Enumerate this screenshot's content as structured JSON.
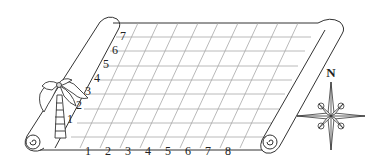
{
  "diagram": {
    "type": "treasure-map-grid",
    "grid": {
      "columns": 8,
      "rows": 8,
      "x_labels": [
        "1",
        "2",
        "3",
        "4",
        "5",
        "6",
        "7",
        "8"
      ],
      "y_labels": [
        "1",
        "2",
        "3",
        "4",
        "5",
        "6",
        "7"
      ],
      "line_color": "#9a9a9a"
    },
    "compass": {
      "north_label": "N"
    },
    "landmark": "palm-tree",
    "colors": {
      "ink": "#222222",
      "grid": "#a0a0a0",
      "background": "#ffffff"
    }
  }
}
